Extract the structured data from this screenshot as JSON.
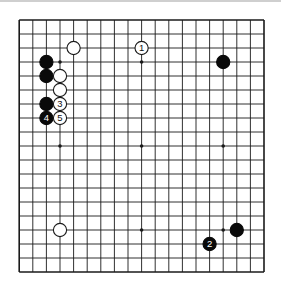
{
  "diagram": {
    "type": "go-board",
    "size": 19,
    "geometry": {
      "x0": 19.2,
      "y0": 20,
      "dx": 13.6,
      "dy": 14.0,
      "stone_radius": 6.6
    },
    "colors": {
      "line": "#1a1a1a",
      "black_stone": "#0a0a0a",
      "white_stone": "#ffffff",
      "white_stroke": "#1a1a1a",
      "background": "#ffffff"
    },
    "star_points": [
      [
        3,
        3
      ],
      [
        9,
        3
      ],
      [
        15,
        3
      ],
      [
        3,
        9
      ],
      [
        9,
        9
      ],
      [
        15,
        9
      ],
      [
        3,
        15
      ],
      [
        9,
        15
      ],
      [
        15,
        15
      ]
    ],
    "stones": [
      {
        "color": "white",
        "col": 9,
        "row": 2,
        "label": "1"
      },
      {
        "color": "white",
        "col": 4,
        "row": 2,
        "label": ""
      },
      {
        "color": "black",
        "col": 15,
        "row": 3,
        "label": ""
      },
      {
        "color": "black",
        "col": 2,
        "row": 3,
        "label": ""
      },
      {
        "color": "black",
        "col": 2,
        "row": 4,
        "label": ""
      },
      {
        "color": "white",
        "col": 3,
        "row": 4,
        "label": ""
      },
      {
        "color": "white",
        "col": 3,
        "row": 5,
        "label": ""
      },
      {
        "color": "black",
        "col": 2,
        "row": 6,
        "label": ""
      },
      {
        "color": "white",
        "col": 3,
        "row": 6,
        "label": "3"
      },
      {
        "color": "black",
        "col": 2,
        "row": 7,
        "label": "4"
      },
      {
        "color": "white",
        "col": 3,
        "row": 7,
        "label": "5"
      },
      {
        "color": "white",
        "col": 3,
        "row": 15,
        "label": ""
      },
      {
        "color": "black",
        "col": 16,
        "row": 15,
        "label": ""
      },
      {
        "color": "black",
        "col": 14,
        "row": 16,
        "label": "2"
      }
    ]
  }
}
